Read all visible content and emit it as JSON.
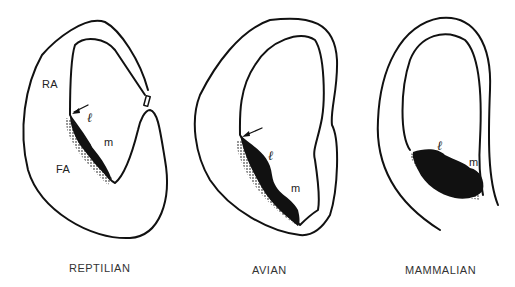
{
  "figure": {
    "panels": [
      {
        "id": "reptilian",
        "caption": "REPTILIAN",
        "labels": {
          "ra": "RA",
          "fa": "FA",
          "l": "ℓ",
          "m": "m"
        }
      },
      {
        "id": "avian",
        "caption": "AVIAN",
        "labels": {
          "l": "ℓ",
          "m": "m"
        }
      },
      {
        "id": "mammalian",
        "caption": "MAMMALIAN",
        "labels": {
          "l": "ℓ",
          "m": "m"
        }
      }
    ]
  }
}
